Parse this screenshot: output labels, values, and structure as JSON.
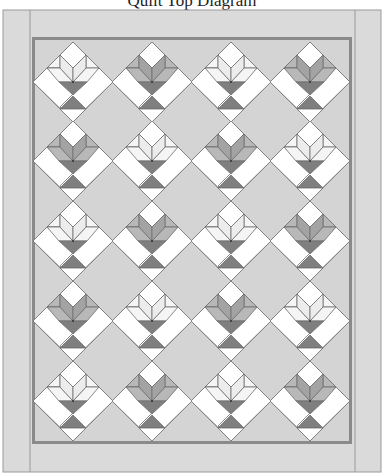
{
  "title": "Quilt Top Diagram",
  "colors": {
    "background": "#d4d4d4",
    "border": "#dadada",
    "border_line": "#9a9a9a",
    "inner_frame": "#8a8a8a",
    "white": "#ffffff",
    "outline": "#6e6e6e",
    "cup": "#7f7f7f",
    "petal_light": "#ececec",
    "petal_light_side": "#f5f5f5",
    "petal_dark": "#a3a3a3",
    "petal_dark_side": "#b8b8b8"
  },
  "grid": {
    "rows": 5,
    "cols": 4,
    "centers_x": [
      73,
      152,
      231,
      310
    ],
    "centers_y": [
      82,
      161,
      241,
      321,
      401
    ],
    "half_diagonal": 40
  },
  "blocks": [
    [
      "light",
      "dark",
      "light",
      "dark"
    ],
    [
      "dark",
      "light",
      "dark",
      "light"
    ],
    [
      "light",
      "dark",
      "light",
      "dark"
    ],
    [
      "dark",
      "light",
      "dark",
      "light"
    ],
    [
      "light",
      "dark",
      "light",
      "dark"
    ]
  ]
}
